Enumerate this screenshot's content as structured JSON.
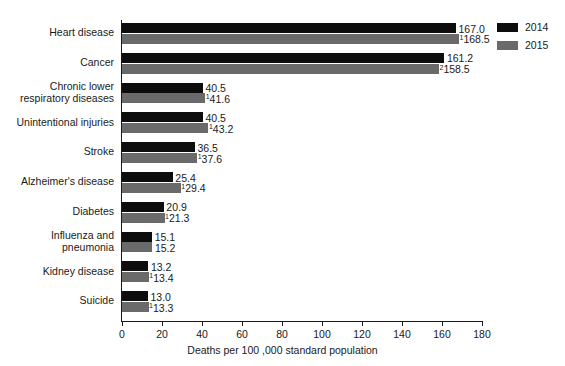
{
  "chart_data": {
    "type": "bar",
    "orientation": "horizontal",
    "title": "",
    "xlabel": "Deaths per 100 ,000 standard population",
    "ylabel": "",
    "xlim": [
      0,
      180
    ],
    "xticks": [
      0,
      20,
      40,
      60,
      80,
      100,
      120,
      140,
      160,
      180
    ],
    "grid": false,
    "legend_position": "top-right",
    "categories": [
      "Heart disease",
      "Cancer",
      "Chronic lower respiratory diseases",
      "Unintentional injuries",
      "Stroke",
      "Alzheimer's disease",
      "Diabetes",
      "Influenza and pneumonia",
      "Kidney disease",
      "Suicide"
    ],
    "category_lines": [
      [
        "Heart disease"
      ],
      [
        "Cancer"
      ],
      [
        "Chronic lower",
        "respiratory diseases"
      ],
      [
        "Unintentional injuries"
      ],
      [
        "Stroke"
      ],
      [
        "Alzheimer's disease"
      ],
      [
        "Diabetes"
      ],
      [
        "Influenza and",
        "pneumonia"
      ],
      [
        "Kidney disease"
      ],
      [
        "Suicide"
      ]
    ],
    "series": [
      {
        "name": "2014",
        "color": "#0d0d0d",
        "values": [
          167.0,
          161.2,
          40.5,
          40.5,
          36.5,
          25.4,
          20.9,
          15.1,
          13.2,
          13.0
        ],
        "labels": [
          "167.0",
          "161.2",
          "40.5",
          "40.5",
          "36.5",
          "25.4",
          "20.9",
          "15.1",
          "13.2",
          "13.0"
        ],
        "footnotes": [
          "",
          "",
          "",
          "",
          "",
          "",
          "",
          "",
          "",
          ""
        ]
      },
      {
        "name": "2015",
        "color": "#6a6a6a",
        "values": [
          168.5,
          158.5,
          41.6,
          43.2,
          37.6,
          29.4,
          21.3,
          15.2,
          13.4,
          13.3
        ],
        "labels": [
          "168.5",
          "158.5",
          "41.6",
          "43.2",
          "37.6",
          "29.4",
          "21.3",
          "15.2",
          "13.4",
          "13.3"
        ],
        "footnotes": [
          "1",
          "2",
          "1",
          "1",
          "1",
          "1",
          "1",
          "",
          "1",
          "1"
        ]
      }
    ]
  },
  "legend": {
    "items": [
      {
        "label": "2014",
        "color": "#0d0d0d"
      },
      {
        "label": "2015",
        "color": "#6a6a6a"
      }
    ]
  },
  "axis": {
    "x_title": "Deaths per 100 ,000 standard population",
    "x_tick_labels": [
      "0",
      "20",
      "40",
      "60",
      "80",
      "100",
      "120",
      "140",
      "160",
      "180"
    ]
  }
}
